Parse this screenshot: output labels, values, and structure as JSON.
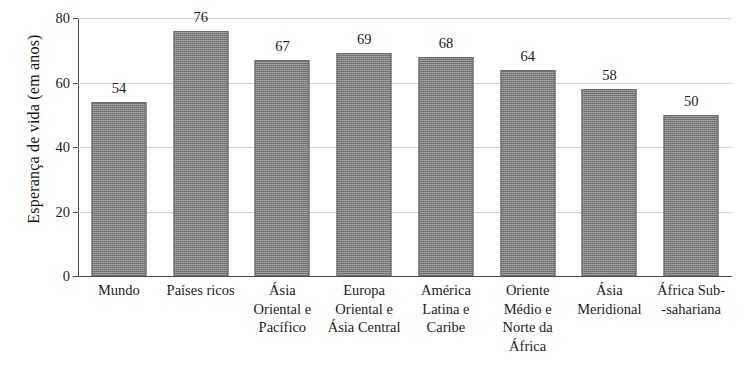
{
  "chart_data": {
    "type": "bar",
    "title": "",
    "xlabel": "",
    "ylabel": "Esperança de vida (em anos)",
    "ylim": [
      0,
      80
    ],
    "yticks": [
      0,
      20,
      40,
      60,
      80
    ],
    "ytick_labels": [
      "0",
      "20",
      "40",
      "60",
      "80"
    ],
    "grid": true,
    "legend": false,
    "categories": [
      "Mundo",
      "Países ricos",
      "Ásia Oriental e Pacífico",
      "Europa Oriental e Ásia Central",
      "América Latina e Caribe",
      "Oriente Médio e Norte da África",
      "Ásia Meridional",
      "África Sub--sahariana"
    ],
    "category_lines": [
      [
        "Mundo"
      ],
      [
        "Países ricos"
      ],
      [
        "Ásia",
        "Oriental e",
        "Pacífico"
      ],
      [
        "Europa",
        "Oriental e",
        "Ásia Central"
      ],
      [
        "América",
        "Latina e",
        "Caribe"
      ],
      [
        "Oriente",
        "Médio e",
        "Norte da",
        "África"
      ],
      [
        "Ásia",
        "Meridional"
      ],
      [
        "África Sub-",
        "-sahariana"
      ]
    ],
    "values": [
      54,
      76,
      67,
      69,
      68,
      64,
      58,
      50
    ],
    "value_labels": [
      "54",
      "76",
      "67",
      "69",
      "68",
      "64",
      "58",
      "50"
    ],
    "bar_color": "#7a7a7a",
    "grid_color": "#d0d0d0",
    "axis_color": "#4a4a4a"
  }
}
